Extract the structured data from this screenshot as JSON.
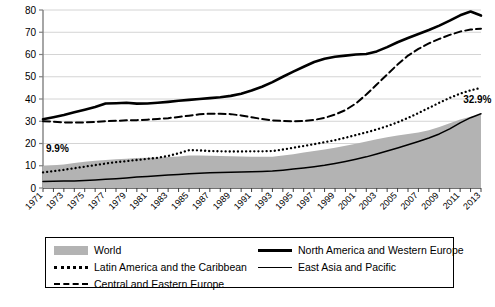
{
  "chart_data": {
    "type": "area",
    "title": "",
    "xlabel": "",
    "ylabel": "",
    "ylim": [
      0,
      80
    ],
    "ytick_values": [
      0,
      10,
      20,
      30,
      40,
      50,
      60,
      70,
      80
    ],
    "grid": true,
    "legend_position": "below",
    "x": [
      1971,
      1972,
      1973,
      1974,
      1975,
      1976,
      1977,
      1978,
      1979,
      1980,
      1981,
      1982,
      1983,
      1984,
      1985,
      1986,
      1987,
      1988,
      1989,
      1990,
      1991,
      1992,
      1993,
      1994,
      1995,
      1996,
      1997,
      1998,
      1999,
      2000,
      2001,
      2002,
      2003,
      2004,
      2005,
      2006,
      2007,
      2008,
      2009,
      2010,
      2011,
      2012,
      2013
    ],
    "xtick_labels": [
      "1971",
      "1973",
      "1975",
      "1977",
      "1979",
      "1981",
      "1983",
      "1985",
      "1987",
      "1989",
      "1991",
      "1993",
      "1995",
      "1997",
      "1999",
      "2001",
      "2003",
      "2005",
      "2007",
      "2009",
      "2011",
      "2013"
    ],
    "series": [
      {
        "name": "World",
        "style": "area",
        "color": "#b3b3b3",
        "values": [
          9.9,
          10.2,
          10.6,
          11.2,
          11.8,
          12.2,
          12.6,
          12.9,
          13.2,
          13.5,
          13.6,
          13.7,
          13.9,
          14.2,
          14.6,
          14.6,
          14.5,
          14.4,
          14.3,
          14.2,
          14.1,
          14.0,
          14.1,
          14.6,
          15.2,
          15.9,
          16.6,
          17.3,
          18.1,
          19.0,
          19.9,
          20.9,
          21.9,
          22.8,
          23.6,
          24.3,
          25.0,
          26.0,
          27.4,
          29.1,
          30.8,
          32.0,
          32.9
        ]
      },
      {
        "name": "North America and Western Europe",
        "style": "solid-thick",
        "color": "#000000",
        "values": [
          30.9,
          31.8,
          32.8,
          34.0,
          35.2,
          36.4,
          38.0,
          38.1,
          38.3,
          37.9,
          38.0,
          38.3,
          38.7,
          39.2,
          39.6,
          40.0,
          40.4,
          40.8,
          41.4,
          42.4,
          43.8,
          45.5,
          47.6,
          50.0,
          52.3,
          54.5,
          56.6,
          58.1,
          59.0,
          59.5,
          60.0,
          60.2,
          61.4,
          63.3,
          65.5,
          67.4,
          69.2,
          71.0,
          73.0,
          75.2,
          77.6,
          79.3,
          77.5
        ]
      },
      {
        "name": "Latin America and the Caribbean",
        "style": "dotted",
        "color": "#000000",
        "values": [
          7.0,
          7.6,
          8.2,
          8.9,
          9.6,
          10.3,
          11.0,
          11.6,
          12.1,
          12.6,
          13.1,
          13.6,
          14.4,
          15.6,
          17.0,
          16.9,
          16.6,
          16.5,
          16.4,
          16.4,
          16.5,
          16.5,
          16.6,
          17.3,
          18.1,
          18.9,
          19.7,
          20.6,
          21.5,
          22.6,
          23.8,
          25.0,
          26.3,
          27.8,
          29.5,
          31.5,
          33.7,
          36.0,
          38.3,
          40.5,
          42.4,
          43.9,
          45.0
        ]
      },
      {
        "name": "East Asia and Pacific",
        "style": "solid-thin",
        "color": "#000000",
        "values": [
          2.9,
          3.0,
          3.1,
          3.2,
          3.4,
          3.6,
          3.9,
          4.2,
          4.5,
          4.9,
          5.2,
          5.5,
          5.8,
          6.1,
          6.4,
          6.6,
          6.8,
          7.0,
          7.1,
          7.2,
          7.3,
          7.4,
          7.6,
          8.0,
          8.5,
          9.0,
          9.6,
          10.2,
          11.0,
          11.9,
          12.9,
          14.0,
          15.3,
          16.6,
          18.0,
          19.4,
          20.9,
          22.5,
          24.3,
          26.6,
          29.3,
          31.6,
          33.4
        ]
      },
      {
        "name": "Central and Eastern Europe",
        "style": "dashed",
        "color": "#000000",
        "values": [
          30.0,
          29.8,
          29.5,
          29.4,
          29.5,
          29.7,
          30.0,
          30.2,
          30.4,
          30.5,
          30.7,
          31.0,
          31.4,
          31.9,
          32.5,
          33.1,
          33.4,
          33.4,
          33.2,
          32.6,
          31.8,
          31.0,
          30.4,
          30.1,
          30.0,
          30.1,
          30.6,
          31.5,
          33.0,
          35.0,
          38.0,
          42.0,
          46.5,
          51.0,
          55.5,
          59.5,
          62.5,
          65.0,
          67.0,
          68.8,
          70.3,
          71.2,
          71.6
        ]
      }
    ],
    "annotations": [
      {
        "text": "9.9%",
        "x_year": 1971,
        "y_value": 16.0
      },
      {
        "text": "32.9%",
        "x_year": 2011,
        "y_value": 38.0
      }
    ]
  },
  "legend": {
    "items": [
      {
        "label": "World",
        "marker": "area-swatch"
      },
      {
        "label": "North America and Western Europe",
        "marker": "solid-thick-line"
      },
      {
        "label": "Latin America and the Caribbean",
        "marker": "dotted-line"
      },
      {
        "label": "East Asia and Pacific",
        "marker": "solid-thin-line"
      },
      {
        "label": "Central and Eastern Europe",
        "marker": "dashed-line"
      }
    ]
  }
}
